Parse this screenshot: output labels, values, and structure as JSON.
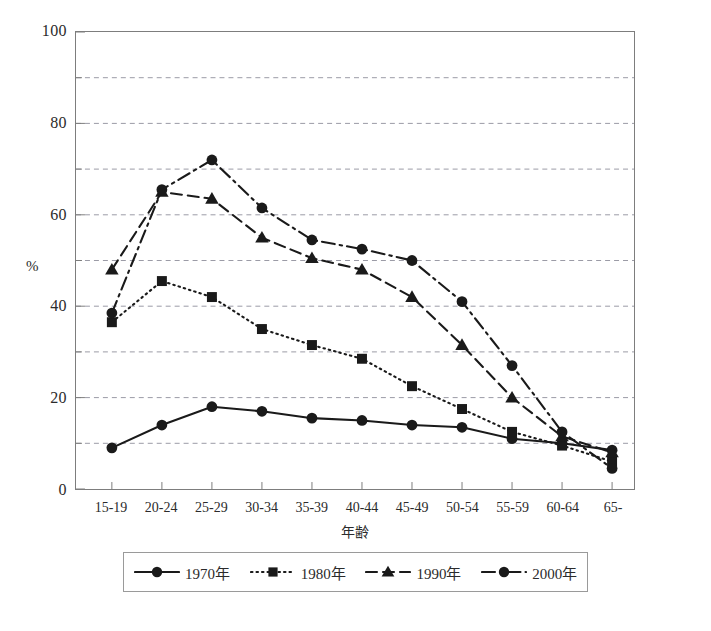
{
  "chart_data": {
    "type": "line",
    "title": "",
    "xlabel": "年齢",
    "ylabel": "%",
    "categories": [
      "15-19",
      "20-24",
      "25-29",
      "30-34",
      "35-39",
      "40-44",
      "45-49",
      "50-54",
      "55-59",
      "60-64",
      "65-"
    ],
    "ylim": [
      0,
      100
    ],
    "y_ticks": [
      0,
      20,
      40,
      60,
      80,
      100
    ],
    "y_gridlines": [
      10,
      20,
      30,
      40,
      50,
      60,
      70,
      80,
      90,
      100
    ],
    "grid": true,
    "legend_position": "bottom",
    "series": [
      {
        "name": "1970年",
        "marker": "circle",
        "line": "solid",
        "values": [
          9.0,
          14.0,
          18.0,
          17.0,
          15.5,
          15.0,
          14.0,
          13.5,
          11.0,
          10.0,
          8.5
        ]
      },
      {
        "name": "1980年",
        "marker": "square",
        "line": "dotted",
        "values": [
          36.5,
          45.5,
          42.0,
          35.0,
          31.5,
          28.5,
          22.5,
          17.5,
          12.5,
          9.5,
          6.0
        ]
      },
      {
        "name": "1990年",
        "marker": "triangle",
        "line": "dashed",
        "values": [
          48.0,
          65.0,
          63.5,
          55.0,
          50.5,
          48.0,
          42.0,
          31.5,
          20.0,
          11.5,
          8.0
        ]
      },
      {
        "name": "2000年",
        "marker": "circle",
        "line": "dashdot",
        "values": [
          38.5,
          65.5,
          72.0,
          61.5,
          54.5,
          52.5,
          50.0,
          41.0,
          27.0,
          12.5,
          4.5
        ]
      }
    ]
  },
  "axis": {
    "y_title": "%",
    "x_title": "年齢",
    "y_tick_labels": [
      "0",
      "20",
      "40",
      "60",
      "80",
      "100"
    ],
    "x_tick_labels": [
      "15-19",
      "20-24",
      "25-29",
      "30-34",
      "35-39",
      "40-44",
      "45-49",
      "50-54",
      "55-59",
      "60-64",
      "65-"
    ]
  },
  "legend": {
    "items": [
      {
        "label": "1970年"
      },
      {
        "label": "1980年"
      },
      {
        "label": "1990年"
      },
      {
        "label": "2000年"
      }
    ]
  },
  "caption": "",
  "colors": {
    "ink": "#1a1a1a",
    "grid": "#9a9aa5",
    "frame": "#7d7d7d"
  }
}
